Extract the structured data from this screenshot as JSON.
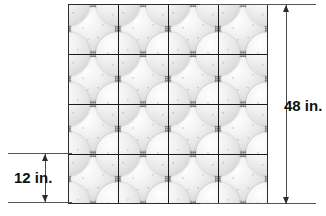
{
  "dimensions": {
    "overall_height": {
      "label": "48 in.",
      "value": 48,
      "unit": "in.",
      "position": "right"
    },
    "tile_height": {
      "label": "12 in.",
      "value": 12,
      "unit": "in.",
      "position": "bottom-left"
    }
  },
  "tile_grid": {
    "rows": 4,
    "columns": 4,
    "tile_count": 16,
    "tile_side_inches": 12,
    "overall_side_inches": 48,
    "motif": "circle",
    "motifs_per_tile": 1
  },
  "colors": {
    "tile_background": "#9c9c9c",
    "motif_light": "#f2f2f2",
    "grid_line": "#2b2b2b",
    "dimension_line": "#4a4a4a",
    "label_text": "#111111",
    "page_background": "#ffffff"
  },
  "chart_data": {
    "type": "table",
    "categories": [
      "Tile side",
      "Tiles per row",
      "Tiles per column",
      "Overall side"
    ],
    "values": [
      12,
      4,
      4,
      48
    ],
    "units": [
      "in.",
      "tiles",
      "tiles",
      "in."
    ],
    "xlabel": "",
    "ylabel": ""
  }
}
